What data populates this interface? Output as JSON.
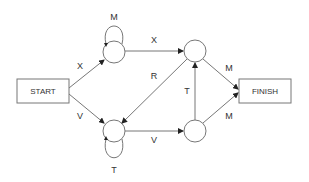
{
  "diagram": {
    "type": "state-machine",
    "colors": {
      "stroke": "#777777",
      "text": "#333333",
      "background": "#ffffff"
    },
    "nodes": [
      {
        "id": "start",
        "shape": "rect",
        "label": "START"
      },
      {
        "id": "s1",
        "shape": "circle",
        "label": ""
      },
      {
        "id": "s2",
        "shape": "circle",
        "label": ""
      },
      {
        "id": "s3",
        "shape": "circle",
        "label": ""
      },
      {
        "id": "s4",
        "shape": "circle",
        "label": ""
      },
      {
        "id": "finish",
        "shape": "rect",
        "label": "FINISH"
      }
    ],
    "edges": [
      {
        "from": "start",
        "to": "s1",
        "label": "X"
      },
      {
        "from": "start",
        "to": "s2",
        "label": "V"
      },
      {
        "from": "s1",
        "to": "s1",
        "label": "M"
      },
      {
        "from": "s2",
        "to": "s2",
        "label": "T"
      },
      {
        "from": "s1",
        "to": "s3",
        "label": "X"
      },
      {
        "from": "s2",
        "to": "s4",
        "label": "V"
      },
      {
        "from": "s3",
        "to": "s2",
        "label": "R"
      },
      {
        "from": "s4",
        "to": "s3",
        "label": "T"
      },
      {
        "from": "s3",
        "to": "finish",
        "label": "M"
      },
      {
        "from": "s4",
        "to": "finish",
        "label": "M"
      }
    ]
  }
}
